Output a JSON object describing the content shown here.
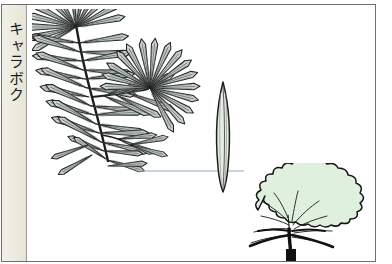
{
  "plate": {
    "label_band": {
      "title": "キャラボク",
      "title_romaji_not_shown": null,
      "background_color": "#efeee4",
      "divider_color": "#9a9a93"
    },
    "frame": {
      "border_color": "#6f6f6f",
      "background_color": "#ffffff"
    },
    "figures": [
      {
        "name": "branch-with-needles",
        "description": "Ink drawing of a yew branch bearing dense spirally set linear needles, with a whorled cluster at the branch tip",
        "ink_color": "#2b2b2b",
        "fill_color": "#cfd6d4"
      },
      {
        "name": "magnified-needle",
        "description": "Single enlarged lanceolate needle showing the midrib",
        "ink_color": "#1d1d1d",
        "fill_color": "#e4ece3"
      },
      {
        "name": "tree-habit-silhouette",
        "description": "Broad low spreading shrubby habit with scalloped canopy outline and dark branching trunk",
        "canopy_color": "#dff0df",
        "outline_color": "#1a1a1a",
        "trunk_color": "#141414"
      },
      {
        "name": "leader-line",
        "description": "Thin blue rule linking a needle on the branch to the magnified needle",
        "color": "#8fa9c8"
      }
    ]
  }
}
